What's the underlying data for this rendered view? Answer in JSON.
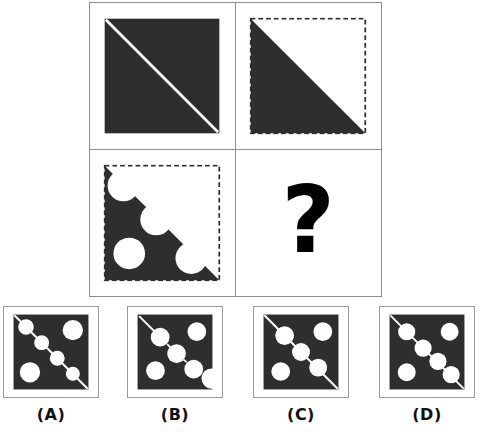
{
  "puzzle": {
    "type": "visual-analogy-matrix",
    "dark_color": "#2e2e2e",
    "light_color": "#ffffff",
    "grid_line_color": "#8c8c8c",
    "matrix": {
      "rows": 2,
      "cols": 2,
      "cells": [
        {
          "position": "top-left",
          "name": "cell-1",
          "description": "solid dark square crossed by a thin white diagonal line from top-left to bottom-right",
          "fill": "full-square",
          "diagonal_line": true,
          "circles_on_diagonal": 0,
          "extra_circles": 0,
          "dashed_border": false
        },
        {
          "position": "top-right",
          "name": "cell-2",
          "description": "dark lower-left triangle, white upper-right half, dashed dark outline around the square",
          "fill": "lower-left-triangle",
          "diagonal_line": false,
          "circles_on_diagonal": 0,
          "extra_circles": 0,
          "dashed_border": true
        },
        {
          "position": "bottom-left",
          "name": "cell-3",
          "description": "dark lower-left triangle with three circular bites removed along the hypotenuse plus one white circle inside the dark area",
          "fill": "lower-left-triangle",
          "diagonal_line": false,
          "circles_on_diagonal": 3,
          "extra_circles": 1,
          "dashed_border": true
        },
        {
          "position": "bottom-right",
          "name": "cell-4-missing",
          "description": "missing element, shown as a bold question mark",
          "fill": "none",
          "is_missing": true,
          "placeholder": "?"
        }
      ]
    },
    "options": [
      {
        "key": "A",
        "label": "(A)",
        "name": "option-a",
        "description": "dark square, full white diagonal line, four white circles on the diagonal, one circle top-right, one circle bottom-left",
        "diagonal_line": "full",
        "circles_on_diagonal": 4,
        "corner_circle_top_right": true,
        "corner_circle_bottom_left": true,
        "notch_bottom_right": false
      },
      {
        "key": "B",
        "label": "(B)",
        "name": "option-b",
        "description": "dark square, short diagonal line stub at top-left, three white circles on the diagonal, one circle top-right, one circle bottom-left, circular notch cut from the bottom-right corner",
        "diagonal_line": "partial",
        "circles_on_diagonal": 3,
        "corner_circle_top_right": true,
        "corner_circle_bottom_left": true,
        "notch_bottom_right": true
      },
      {
        "key": "C",
        "label": "(C)",
        "name": "option-c",
        "description": "dark square, full white diagonal line, three white circles on the diagonal, one circle top-right, one circle bottom-left",
        "diagonal_line": "full",
        "circles_on_diagonal": 3,
        "corner_circle_top_right": true,
        "corner_circle_bottom_left": true,
        "notch_bottom_right": false
      },
      {
        "key": "D",
        "label": "(D)",
        "name": "option-d",
        "description": "dark square, full white diagonal line, four white circles on the diagonal, one circle top-right, one circle bottom-left",
        "diagonal_line": "full",
        "circles_on_diagonal": 4,
        "corner_circle_top_right": true,
        "corner_circle_bottom_left": true,
        "notch_bottom_right": false
      }
    ],
    "question_mark": "?"
  }
}
